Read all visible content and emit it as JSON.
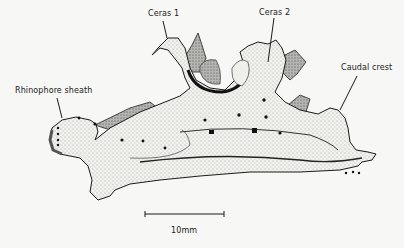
{
  "figure": {
    "labels": [
      {
        "id": "ceras-1",
        "text": "Ceras 1"
      },
      {
        "id": "ceras-2",
        "text": "Ceras 2"
      },
      {
        "id": "caudal-crest",
        "text": "Caudal crest"
      },
      {
        "id": "rhinophore-sheath",
        "text": "Rhinophore sheath"
      }
    ],
    "scale_bar": {
      "label": "10mm"
    },
    "colors": {
      "background": "#f7f7f5",
      "ink": "#1a1a1a",
      "shade": "#8a8a8a"
    }
  }
}
